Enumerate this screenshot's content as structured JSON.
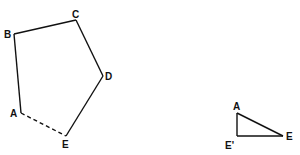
{
  "diagram": {
    "pentagon": {
      "vertices": [
        "B",
        "C",
        "D",
        "E",
        "A"
      ],
      "edges": [
        {
          "from": "A",
          "to": "B",
          "style": "solid"
        },
        {
          "from": "B",
          "to": "C",
          "style": "solid"
        },
        {
          "from": "C",
          "to": "D",
          "style": "solid"
        },
        {
          "from": "D",
          "to": "E",
          "style": "solid"
        },
        {
          "from": "E",
          "to": "A",
          "style": "dashed"
        }
      ],
      "labels": {
        "A": "A",
        "B": "B",
        "C": "C",
        "D": "D",
        "E": "E"
      }
    },
    "triangle": {
      "vertices": [
        "A",
        "E'",
        "E"
      ],
      "labels": {
        "A": "A",
        "Eprime": "E'",
        "E": "E"
      },
      "right_angle_at": "E'"
    }
  }
}
